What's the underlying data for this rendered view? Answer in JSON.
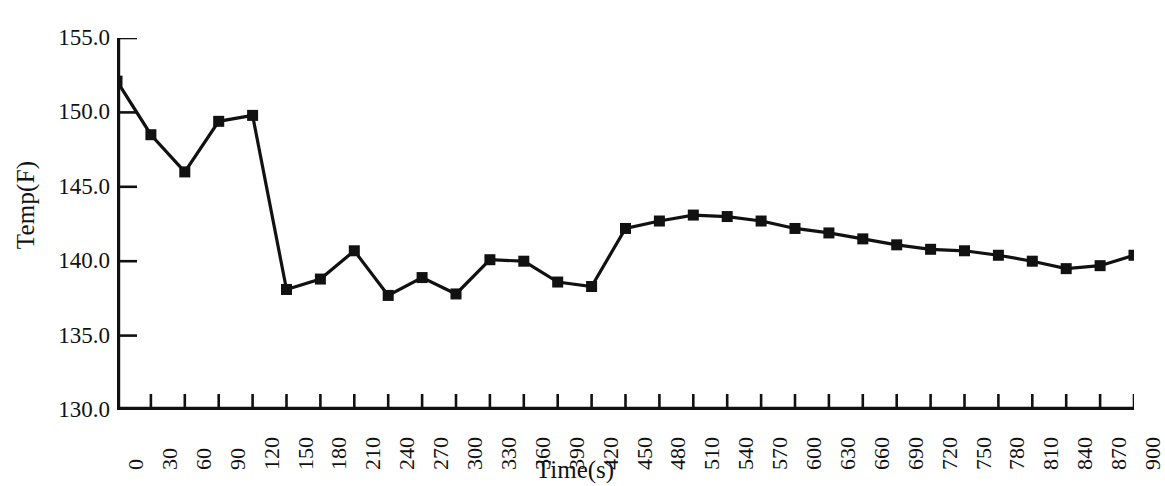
{
  "chart_data": {
    "type": "line",
    "title": "",
    "subtitle": "",
    "xlabel": "Time(s)",
    "ylabel": "Temp(F)",
    "xlim": [
      0,
      900
    ],
    "ylim": [
      130.0,
      155.0
    ],
    "ytick_labels": [
      "155.0",
      "150.0",
      "145.0",
      "140.0",
      "135.0",
      "130.0"
    ],
    "yticks": [
      155.0,
      150.0,
      145.0,
      140.0,
      135.0,
      130.0
    ],
    "xtick_labels": [
      "0",
      "30",
      "60",
      "90",
      "120",
      "150",
      "180",
      "210",
      "240",
      "270",
      "300",
      "330",
      "360",
      "390",
      "420",
      "450",
      "480",
      "510",
      "540",
      "570",
      "600",
      "630",
      "660",
      "690",
      "720",
      "750",
      "780",
      "810",
      "840",
      "870",
      "900"
    ],
    "x": [
      0,
      30,
      60,
      90,
      120,
      150,
      180,
      210,
      240,
      270,
      300,
      330,
      360,
      390,
      420,
      450,
      480,
      510,
      540,
      570,
      600,
      630,
      660,
      690,
      720,
      750,
      780,
      810,
      840,
      870,
      900
    ],
    "values": [
      152.1,
      148.5,
      146.0,
      149.4,
      149.8,
      138.1,
      138.8,
      140.7,
      137.7,
      138.9,
      137.8,
      140.1,
      140.0,
      138.6,
      138.3,
      142.2,
      142.7,
      143.1,
      143.0,
      142.7,
      142.2,
      141.9,
      141.5,
      141.1,
      140.8,
      140.7,
      140.4,
      140.0,
      139.5,
      139.7,
      140.4
    ],
    "series": [
      {
        "name": "Temp(F)",
        "color": "#111111",
        "marker": "square",
        "values": [
          152.1,
          148.5,
          146.0,
          149.4,
          149.8,
          138.1,
          138.8,
          140.7,
          137.7,
          138.9,
          137.8,
          140.1,
          140.0,
          138.6,
          138.3,
          142.2,
          142.7,
          143.1,
          143.0,
          142.7,
          142.2,
          141.9,
          141.5,
          141.1,
          140.8,
          140.7,
          140.4,
          140.0,
          139.5,
          139.7,
          140.4
        ]
      }
    ],
    "grid": false,
    "legend": "none",
    "line_color": "#111111",
    "axis_color": "#111111",
    "background_color": "#ffffff"
  }
}
